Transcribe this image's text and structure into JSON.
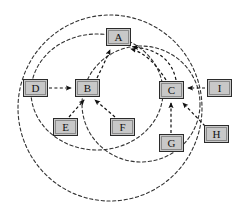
{
  "diagram": {
    "title": "",
    "type": "directed-graph-with-dashed-boundary-circles",
    "style": {
      "node_fill": "#c8c8c8",
      "node_stroke": "#2b2b2b",
      "edge_color": "#1a1a1a",
      "circle_color": "#333333",
      "background": "#ffffff",
      "edge_style": "dashed",
      "circle_style": "dashed"
    },
    "nodes": [
      {
        "id": "A",
        "label": "A",
        "x": 106,
        "y": 28,
        "w": 25,
        "h": 18
      },
      {
        "id": "B",
        "label": "B",
        "x": 75,
        "y": 79,
        "w": 25,
        "h": 18
      },
      {
        "id": "C",
        "label": "C",
        "x": 159,
        "y": 81,
        "w": 25,
        "h": 18
      },
      {
        "id": "D",
        "label": "D",
        "x": 23,
        "y": 79,
        "w": 25,
        "h": 18
      },
      {
        "id": "E",
        "label": "E",
        "x": 53,
        "y": 118,
        "w": 25,
        "h": 18
      },
      {
        "id": "F",
        "label": "F",
        "x": 110,
        "y": 118,
        "w": 25,
        "h": 18
      },
      {
        "id": "G",
        "label": "G",
        "x": 159,
        "y": 134,
        "w": 25,
        "h": 18
      },
      {
        "id": "H",
        "label": "H",
        "x": 204,
        "y": 125,
        "w": 25,
        "h": 18
      },
      {
        "id": "I",
        "label": "I",
        "x": 207,
        "y": 79,
        "w": 25,
        "h": 18
      }
    ],
    "edges": [
      {
        "from": "D",
        "to": "B",
        "label": ""
      },
      {
        "from": "E",
        "to": "B",
        "label": ""
      },
      {
        "from": "F",
        "to": "B",
        "label": ""
      },
      {
        "from": "B",
        "to": "A",
        "label": ""
      },
      {
        "from": "C",
        "to": "A",
        "label": ""
      },
      {
        "from": "G",
        "to": "C",
        "label": ""
      },
      {
        "from": "H",
        "to": "C",
        "label": ""
      },
      {
        "from": "I",
        "to": "C",
        "label": ""
      }
    ],
    "boundaries": [
      {
        "name": "outer-circle",
        "cx": 110,
        "cy": 108,
        "rx": 92,
        "ry": 93
      },
      {
        "name": "middle-circle",
        "cx": 97,
        "cy": 92,
        "rx": 66,
        "ry": 58
      },
      {
        "name": "inner-circle",
        "cx": 140,
        "cy": 105,
        "rx": 60,
        "ry": 58
      }
    ]
  }
}
